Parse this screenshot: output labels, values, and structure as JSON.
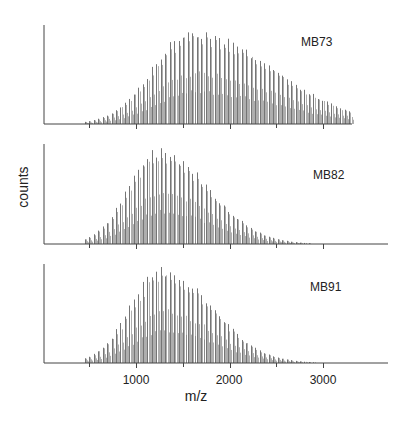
{
  "figure": {
    "ylabel": "counts",
    "xlabel": "m/z",
    "x_ticks_major": [
      1000,
      2000,
      3000
    ],
    "x_ticks_minor": [
      500,
      1500,
      2500
    ],
    "x_tick_labels": [
      "1000",
      "2000",
      "3000"
    ]
  },
  "chart_data": [
    {
      "type": "bar",
      "title": "MB73",
      "xlabel": "m/z",
      "ylabel": "counts",
      "xlim": [
        0,
        3300
      ],
      "ylim": [
        0,
        1
      ],
      "grid": false,
      "envelope": {
        "start_mz": 450,
        "peak_mz": 1600,
        "end_mz": 3300,
        "sigma_left": 420,
        "sigma_right": 850,
        "relative_height_at_end": 0.12
      },
      "x": [
        500,
        750,
        1000,
        1250,
        1500,
        1600,
        1750,
        2000,
        2250,
        2500,
        2750,
        3000,
        3300
      ],
      "values": [
        0.05,
        0.2,
        0.48,
        0.8,
        0.97,
        1.0,
        0.95,
        0.75,
        0.55,
        0.38,
        0.26,
        0.18,
        0.1
      ]
    },
    {
      "type": "bar",
      "title": "MB82",
      "xlabel": "m/z",
      "ylabel": "counts",
      "xlim": [
        0,
        3700
      ],
      "ylim": [
        0,
        1
      ],
      "grid": false,
      "envelope": {
        "start_mz": 450,
        "peak_mz": 1250,
        "end_mz": 3700,
        "sigma_left": 330,
        "sigma_right": 520,
        "relative_height_at_end": 0.0
      },
      "x": [
        500,
        750,
        1000,
        1250,
        1500,
        1750,
        2000,
        2250,
        2500,
        2750,
        3000,
        3500
      ],
      "values": [
        0.07,
        0.35,
        0.78,
        1.0,
        0.82,
        0.55,
        0.3,
        0.14,
        0.06,
        0.02,
        0.01,
        0.0
      ]
    },
    {
      "type": "bar",
      "title": "MB91",
      "xlabel": "m/z",
      "ylabel": "counts",
      "xlim": [
        0,
        3700
      ],
      "ylim": [
        0,
        1
      ],
      "grid": false,
      "envelope": {
        "start_mz": 450,
        "peak_mz": 1280,
        "end_mz": 3700,
        "sigma_left": 340,
        "sigma_right": 520,
        "relative_height_at_end": 0.0
      },
      "x": [
        500,
        750,
        1000,
        1250,
        1500,
        1750,
        2000,
        2250,
        2500,
        2750,
        3000,
        3500
      ],
      "values": [
        0.06,
        0.3,
        0.75,
        1.0,
        0.85,
        0.58,
        0.32,
        0.15,
        0.06,
        0.02,
        0.01,
        0.0
      ]
    }
  ],
  "panels": [
    {
      "label": "MB73"
    },
    {
      "label": "MB82"
    },
    {
      "label": "MB91"
    }
  ],
  "colors": {
    "axis": "#444444",
    "peaks": "#6e6e6e",
    "text": "#222222"
  }
}
